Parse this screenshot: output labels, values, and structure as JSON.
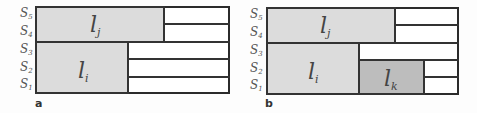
{
  "panels": [
    {
      "id": "a",
      "label": "a",
      "row_labels": [
        {
          "base": "S",
          "sub": "5"
        },
        {
          "base": "S",
          "sub": "4"
        },
        {
          "base": "S",
          "sub": "3"
        },
        {
          "base": "S",
          "sub": "2"
        },
        {
          "base": "S",
          "sub": "1"
        }
      ],
      "blocks": [
        {
          "name": "l_j",
          "base": "l",
          "sub": "j",
          "rows": "S4-S5"
        },
        {
          "name": "l_i",
          "base": "l",
          "sub": "i",
          "rows": "S1-S3"
        }
      ]
    },
    {
      "id": "b",
      "label": "b",
      "row_labels": [
        {
          "base": "S",
          "sub": "5"
        },
        {
          "base": "S",
          "sub": "4"
        },
        {
          "base": "S",
          "sub": "3"
        },
        {
          "base": "S",
          "sub": "2"
        },
        {
          "base": "S",
          "sub": "1"
        }
      ],
      "blocks": [
        {
          "name": "l_j",
          "base": "l",
          "sub": "j",
          "rows": "S4-S5"
        },
        {
          "name": "l_i",
          "base": "l",
          "sub": "i",
          "rows": "S1-S3"
        },
        {
          "name": "l_k",
          "base": "l",
          "sub": "k",
          "rows": "S1-S2"
        }
      ]
    }
  ],
  "colors": {
    "border": "#333333",
    "light_fill": "#dcdcdc",
    "dark_fill": "#bdbdbd",
    "empty_fill": "#ffffff"
  }
}
